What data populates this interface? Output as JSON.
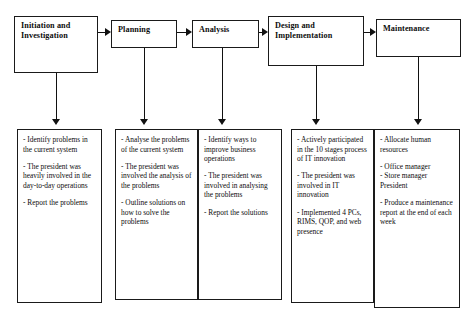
{
  "figure": {
    "title": ""
  },
  "stages": [
    {
      "id": "initiation-and-investigation",
      "label": "Initiation and\nInvestigation",
      "details": [
        "- Identify problems in the current system",
        "- The president was heavily involved in the day-to-day operations",
        "- Report the problems"
      ]
    },
    {
      "id": "planning",
      "label": "Planning",
      "details": [
        "- Analyse the problems of the current system",
        "- The president was involved the analysis of the problems",
        "- Outline solutions on how to solve the problems"
      ]
    },
    {
      "id": "analysis",
      "label": "Analysis",
      "details": [
        "- Identify ways to improve business operations",
        "- The president was involved in analysing the problems",
        "- Report the solutions"
      ]
    },
    {
      "id": "design-and-implementation",
      "label": "Design and\nImplementation",
      "details": [
        "- Actively participated in the 10 stages process of IT innovation",
        "- The president was involved in IT innovation",
        "- Implemented 4 PCs, RIMS, QOP, and web presence"
      ]
    },
    {
      "id": "maintenance",
      "label": "Maintenance",
      "details": [
        "- Allocate human resources",
        "- Office manager\n- Store manager\nPresident",
        "- Produce a maintenance report at the end of each week"
      ]
    }
  ],
  "connectors": {
    "flow_arrow_icon": "arrow-right-icon",
    "drop_arrow_icon": "arrow-down-icon"
  },
  "colors": {
    "stroke": "#1a1a1a",
    "background": "#ffffff",
    "text": "#0d0d0d"
  }
}
